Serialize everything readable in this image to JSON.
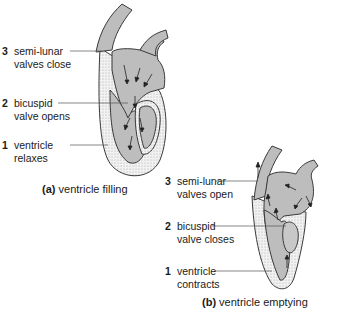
{
  "panel_a": {
    "caption_prefix": "(a)",
    "caption": "ventricle filling",
    "labels": [
      {
        "num": "3",
        "line1": "semi-lunar",
        "line2": "valves close"
      },
      {
        "num": "2",
        "line1": "bicuspid",
        "line2": "valve opens"
      },
      {
        "num": "1",
        "line1": "ventricle",
        "line2": "relaxes"
      }
    ]
  },
  "panel_b": {
    "caption_prefix": "(b)",
    "caption": "ventricle emptying",
    "labels": [
      {
        "num": "3",
        "line1": "semi-lunar",
        "line2": "valves open"
      },
      {
        "num": "2",
        "line1": "bicuspid",
        "line2": "valve closes"
      },
      {
        "num": "1",
        "line1": "ventricle",
        "line2": "contracts"
      }
    ]
  },
  "colors": {
    "chamber": "#bdbdbd",
    "wall": "#ececec",
    "outline": "#3a3a3a"
  }
}
